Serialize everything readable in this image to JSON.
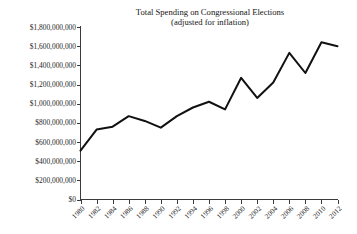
{
  "chart_data": {
    "type": "line",
    "title": "Total Spending on Congressional Elections",
    "subtitle": "(adjusted for inflation)",
    "xlabel": "",
    "ylabel": "",
    "categories": [
      "1980",
      "1982",
      "1984",
      "1986",
      "1988",
      "1990",
      "1992",
      "1994",
      "1996",
      "1998",
      "2000",
      "2002",
      "2004",
      "2006",
      "2008",
      "2010",
      "2012"
    ],
    "values": [
      510000000,
      730000000,
      760000000,
      870000000,
      820000000,
      750000000,
      870000000,
      960000000,
      1020000000,
      940000000,
      1270000000,
      1060000000,
      1220000000,
      1530000000,
      1320000000,
      1640000000,
      1600000000
    ],
    "ylim": [
      0,
      1800000000
    ],
    "ytick_values": [
      0,
      200000000,
      400000000,
      600000000,
      800000000,
      1000000000,
      1200000000,
      1400000000,
      1600000000,
      1800000000
    ],
    "ytick_labels": [
      "$0",
      "$200,000,000",
      "$400,000,000",
      "$600,000,000",
      "$800,000,000",
      "$1,000,000,000",
      "$1,200,000,000",
      "$1,400,000,000",
      "$1,600,000,000",
      "$1,800,000,000"
    ],
    "grid": false,
    "legend": null,
    "series_color": "#111111",
    "axis_color": "#3b3b3b",
    "background": "#ffffff",
    "xtick_rotation_degrees": -45
  }
}
